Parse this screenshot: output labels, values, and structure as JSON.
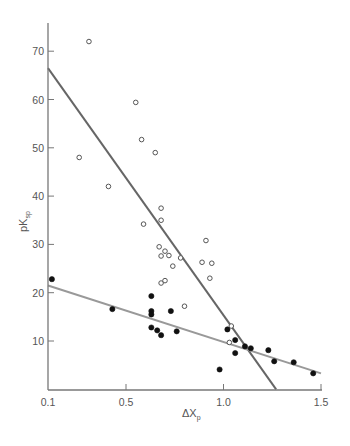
{
  "chart_data": {
    "type": "scatter",
    "title": "",
    "xlabel": "ΔXp",
    "xlabel_main": "ΔX",
    "xlabel_sub": "p",
    "ylabel": "pKsp",
    "ylabel_main": "pK",
    "ylabel_sub": "sp",
    "xlim": [
      0.1,
      1.5
    ],
    "ylim": [
      0,
      75
    ],
    "grid": false,
    "legend": null,
    "x_ticks": [
      "0.1",
      "0.5",
      "1.0",
      "1.5"
    ],
    "y_ticks": [
      "10",
      "20",
      "30",
      "40",
      "50",
      "60",
      "70"
    ],
    "series": [
      {
        "name": "open circles",
        "marker": "open-circle",
        "color": "#555555",
        "points": [
          [
            0.31,
            72.0
          ],
          [
            0.26,
            48.0
          ],
          [
            0.41,
            42.0
          ],
          [
            0.55,
            59.4
          ],
          [
            0.58,
            51.7
          ],
          [
            0.65,
            49.0
          ],
          [
            0.68,
            37.5
          ],
          [
            0.68,
            35.0
          ],
          [
            0.59,
            34.2
          ],
          [
            0.67,
            29.5
          ],
          [
            0.68,
            27.6
          ],
          [
            0.7,
            28.6
          ],
          [
            0.72,
            27.7
          ],
          [
            0.78,
            27.2
          ],
          [
            0.74,
            25.5
          ],
          [
            0.91,
            30.8
          ],
          [
            0.89,
            26.3
          ],
          [
            0.94,
            26.1
          ],
          [
            0.93,
            23.0
          ],
          [
            0.68,
            22.0
          ],
          [
            0.7,
            22.5
          ],
          [
            0.8,
            17.2
          ],
          [
            1.04,
            13.1
          ],
          [
            1.03,
            9.7
          ]
        ]
      },
      {
        "name": "filled circles",
        "marker": "filled-circle",
        "color": "#111111",
        "points": [
          [
            0.12,
            22.8
          ],
          [
            0.43,
            16.6
          ],
          [
            0.63,
            19.3
          ],
          [
            0.63,
            16.2
          ],
          [
            0.63,
            15.5
          ],
          [
            0.63,
            12.8
          ],
          [
            0.66,
            12.2
          ],
          [
            0.68,
            11.2
          ],
          [
            0.73,
            16.2
          ],
          [
            0.76,
            12.0
          ],
          [
            1.02,
            12.4
          ],
          [
            1.06,
            10.2
          ],
          [
            1.06,
            7.5
          ],
          [
            0.98,
            4.1
          ],
          [
            1.11,
            8.9
          ],
          [
            1.14,
            8.5
          ],
          [
            1.23,
            8.1
          ],
          [
            1.26,
            5.8
          ],
          [
            1.36,
            5.6
          ],
          [
            1.46,
            3.3
          ]
        ]
      }
    ],
    "fit_lines": [
      {
        "name": "open-circle fit (steep)",
        "color": "#666666",
        "from": [
          0.1,
          66.5
        ],
        "to": [
          1.27,
          0.0
        ]
      },
      {
        "name": "filled-circle fit (shallow)",
        "color": "#999999",
        "from": [
          0.1,
          21.5
        ],
        "to": [
          1.5,
          3.3
        ]
      }
    ]
  }
}
